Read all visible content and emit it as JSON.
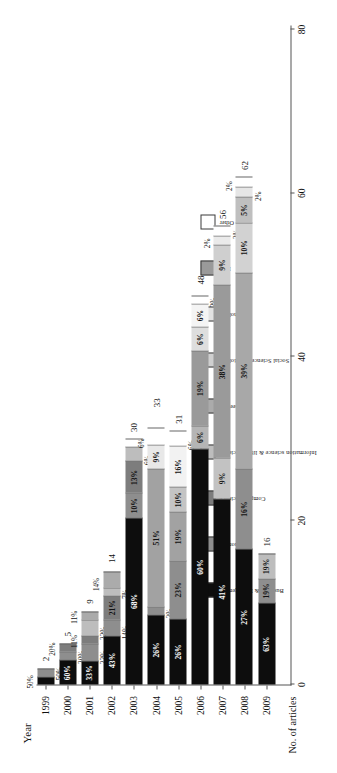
{
  "figure": {
    "x_axis_title": "Year",
    "y_axis_title": "No. of articles",
    "y_ticks": [
      "0",
      "20",
      "40",
      "60",
      "80"
    ]
  },
  "legend": {
    "items": [
      {
        "label": "Business & Management",
        "color": "#0d0d0d"
      },
      {
        "label": "Economics",
        "color": "#8e8e8e"
      },
      {
        "label": "Computer science",
        "color": "#7d7d7d"
      },
      {
        "label": "Information science & library science",
        "color": "#bdbdbd"
      },
      {
        "label": "Engineering",
        "color": "#ababab"
      },
      {
        "label": "Social Sciences/ Sociology",
        "color": "#cfcfcf"
      },
      {
        "label": "Psychology",
        "color": "#e2e2e2"
      },
      {
        "label": "Law",
        "color": "#9a9a9a"
      },
      {
        "label": "Other",
        "color": "#ffffff"
      }
    ]
  },
  "chart_data": {
    "type": "bar",
    "subtype": "stacked-percentage-horizontal",
    "title": "",
    "xlabel": "Year",
    "ylabel": "No. of articles",
    "ylim": [
      0,
      80
    ],
    "ygrid": false,
    "legend_position": "top-left",
    "categories": [
      "1999",
      "2000",
      "2001",
      "2002",
      "2003",
      "2004",
      "2005",
      "2006",
      "2007",
      "2008",
      "2009"
    ],
    "totals": [
      2,
      5,
      9,
      14,
      30,
      33,
      31,
      48,
      56,
      62,
      16
    ],
    "series_names": [
      "Business & Management",
      "Economics",
      "Computer science",
      "Information science & library science",
      "Engineering",
      "Social Sciences/ Sociology",
      "Psychology",
      "Law",
      "Other"
    ],
    "bars": [
      {
        "year": "1999",
        "total": 2,
        "segments": [
          {
            "name": "Business & Management",
            "pct": 50,
            "label": "50%",
            "color": "#0d0d0d"
          },
          {
            "name": "Economics",
            "pct": 50,
            "label": "50%",
            "color": "#8e8e8e"
          }
        ]
      },
      {
        "year": "2000",
        "total": 5,
        "segments": [
          {
            "name": "Business & Management",
            "pct": 60,
            "label": "60%",
            "color": "#0d0d0d"
          },
          {
            "name": "Economics",
            "pct": 20,
            "label": "20%",
            "color": "#8e8e8e"
          },
          {
            "name": "Computer science",
            "pct": 20,
            "label": "20%",
            "color": "#7d7d7d"
          }
        ]
      },
      {
        "year": "2001",
        "total": 9,
        "segments": [
          {
            "name": "Business & Management",
            "pct": 33,
            "label": "33%",
            "color": "#0d0d0d"
          },
          {
            "name": "Economics",
            "pct": 22,
            "label": "22%",
            "color": "#8e8e8e"
          },
          {
            "name": "Computer science",
            "pct": 11,
            "label": "11%",
            "color": "#7d7d7d"
          },
          {
            "name": "Information science & library science",
            "pct": 22,
            "label": "22%",
            "color": "#bdbdbd"
          },
          {
            "name": "Engineering",
            "pct": 11,
            "label": "11%",
            "color": "#ababab"
          }
        ]
      },
      {
        "year": "2002",
        "total": 14,
        "segments": [
          {
            "name": "Business & Management",
            "pct": 43,
            "label": "43%",
            "color": "#0d0d0d"
          },
          {
            "name": "Economics",
            "pct": 14,
            "label": "14%",
            "color": "#8e8e8e"
          },
          {
            "name": "Computer science",
            "pct": 21,
            "label": "21%",
            "color": "#7d7d7d"
          },
          {
            "name": "Information science & library science",
            "pct": 7,
            "label": "7%",
            "color": "#bdbdbd"
          },
          {
            "name": "Engineering",
            "pct": 14,
            "label": "14%",
            "color": "#ababab"
          }
        ]
      },
      {
        "year": "2003",
        "total": 30,
        "segments": [
          {
            "name": "Business & Management",
            "pct": 68,
            "label": "68%",
            "color": "#0d0d0d"
          },
          {
            "name": "Economics",
            "pct": 10,
            "label": "10%",
            "color": "#8e8e8e"
          },
          {
            "name": "Computer science",
            "pct": 13,
            "label": "13%",
            "color": "#7d7d7d"
          },
          {
            "name": "Information science & library science",
            "pct": 6,
            "label": "6%",
            "color": "#bdbdbd"
          },
          {
            "name": "Other",
            "pct": 3,
            "label": "",
            "color": "#ffffff"
          }
        ]
      },
      {
        "year": "2004",
        "total": 33,
        "segments": [
          {
            "name": "Business & Management",
            "pct": 26,
            "label": "26%",
            "color": "#0d0d0d"
          },
          {
            "name": "Economics",
            "pct": 3,
            "label": "3%",
            "color": "#8e8e8e"
          },
          {
            "name": "Computer science",
            "pct": 51,
            "label": "51%",
            "color": "#a2a2a2"
          },
          {
            "name": "Information science & library science",
            "pct": 9,
            "label": "9%",
            "color": "#e8e8e8"
          },
          {
            "name": "Engineering",
            "pct": 6,
            "label": "6%",
            "color": "#ffffff"
          }
        ]
      },
      {
        "year": "2005",
        "total": 31,
        "segments": [
          {
            "name": "Business & Management",
            "pct": 26,
            "label": "26%",
            "color": "#0d0d0d"
          },
          {
            "name": "Economics",
            "pct": 23,
            "label": "23%",
            "color": "#8e8e8e"
          },
          {
            "name": "Computer science",
            "pct": 19,
            "label": "19%",
            "color": "#a2a2a2"
          },
          {
            "name": "Information science & library science",
            "pct": 10,
            "label": "10%",
            "color": "#c4c4c4"
          },
          {
            "name": "Engineering",
            "pct": 16,
            "label": "16%",
            "color": "#f2f2f2"
          },
          {
            "name": "Other",
            "pct": 6,
            "label": "6%",
            "color": "#ffffff"
          }
        ]
      },
      {
        "year": "2006",
        "total": 48,
        "segments": [
          {
            "name": "Business & Management",
            "pct": 60,
            "label": "60%",
            "color": "#0d0d0d"
          },
          {
            "name": "Economics",
            "pct": 6,
            "label": "6%",
            "color": "#b5b5b5"
          },
          {
            "name": "Computer science",
            "pct": 19,
            "label": "19%",
            "color": "#9a9a9a"
          },
          {
            "name": "Information science & library science",
            "pct": 6,
            "label": "6%",
            "color": "#dedede"
          },
          {
            "name": "Engineering",
            "pct": 6,
            "label": "6%",
            "color": "#f4f4f4"
          },
          {
            "name": "Other",
            "pct": 2,
            "label": "2%",
            "color": "#ffffff"
          }
        ]
      },
      {
        "year": "2007",
        "total": 56,
        "segments": [
          {
            "name": "Business & Management",
            "pct": 41,
            "label": "41%",
            "color": "#0d0d0d"
          },
          {
            "name": "Economics",
            "pct": 9,
            "label": "9%",
            "color": "#c2c2c2"
          },
          {
            "name": "Computer science",
            "pct": 38,
            "label": "38%",
            "color": "#9a9a9a"
          },
          {
            "name": "Information science & library science",
            "pct": 9,
            "label": "9%",
            "color": "#cfcfcf"
          },
          {
            "name": "Engineering",
            "pct": 2,
            "label": "2%",
            "color": "#eaeaea"
          },
          {
            "name": "Other",
            "pct": 2,
            "label": "2%",
            "color": "#ffffff"
          }
        ]
      },
      {
        "year": "2008",
        "total": 62,
        "segments": [
          {
            "name": "Business & Management",
            "pct": 27,
            "label": "27%",
            "color": "#0d0d0d"
          },
          {
            "name": "Economics",
            "pct": 16,
            "label": "16%",
            "color": "#8e8e8e"
          },
          {
            "name": "Computer science",
            "pct": 39,
            "label": "39%",
            "color": "#a8a8a8"
          },
          {
            "name": "Information science & library science",
            "pct": 10,
            "label": "10%",
            "color": "#d2d2d2"
          },
          {
            "name": "Engineering",
            "pct": 5,
            "label": "5%",
            "color": "#bfbfbf"
          },
          {
            "name": "Social Sciences/ Sociology",
            "pct": 2,
            "label": "2%",
            "color": "#e6e6e6"
          },
          {
            "name": "Other",
            "pct": 2,
            "label": "2%",
            "color": "#ffffff"
          }
        ]
      },
      {
        "year": "2009",
        "total": 16,
        "segments": [
          {
            "name": "Business & Management",
            "pct": 63,
            "label": "63%",
            "color": "#0d0d0d"
          },
          {
            "name": "Economics",
            "pct": 19,
            "label": "19%",
            "color": "#8e8e8e"
          },
          {
            "name": "Computer science",
            "pct": 19,
            "label": "19%",
            "color": "#bdbdbd"
          }
        ]
      }
    ]
  }
}
